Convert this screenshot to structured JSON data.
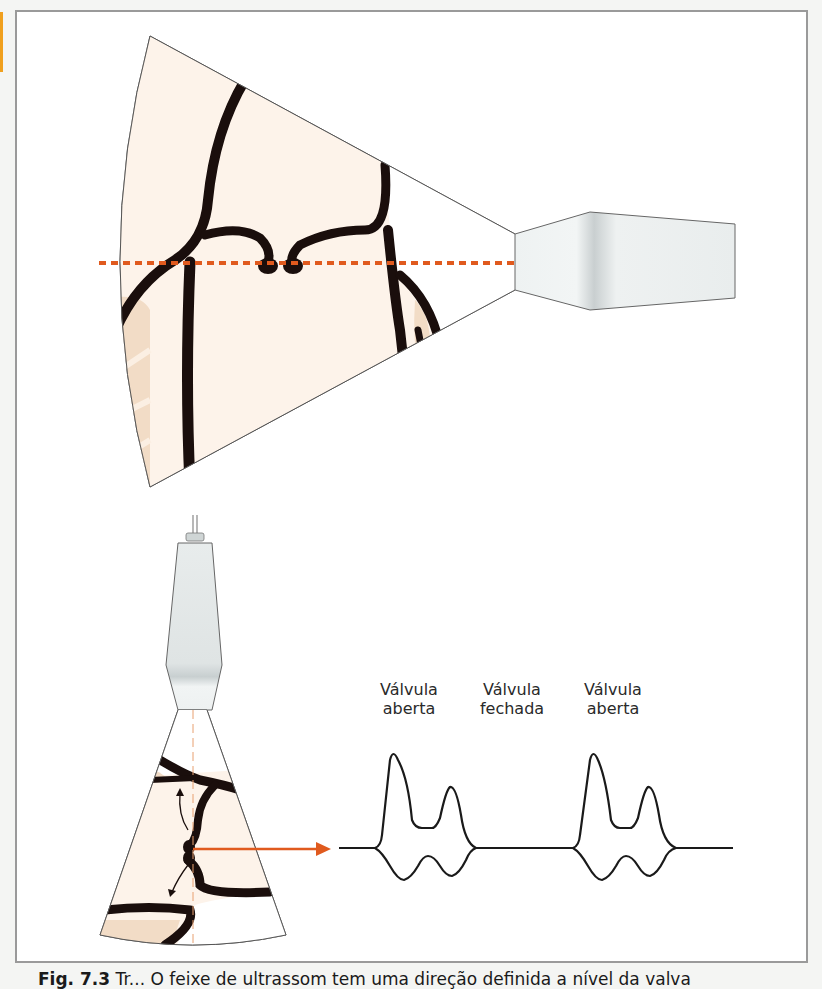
{
  "figure": {
    "accent_color": "#e05a1e",
    "tissue_color": "#fbefe3",
    "wall_color": "#1a0e0c",
    "border_color": "#9a9a9a"
  },
  "top_panel": {
    "description": "Sector scan with horizontal dotted scan line through valve leaflets",
    "scan_line_style": "dotted",
    "transducer": "transducer-probe-horizontal"
  },
  "bottom_panel": {
    "transducer": "transducer-probe-vertical",
    "arrow": "m-mode-projection-arrow",
    "labels": [
      {
        "line1": "Válvula",
        "line2": "aberta"
      },
      {
        "line1": "Válvula",
        "line2": "fechada"
      },
      {
        "line1": "Válvula",
        "line2": "aberta"
      }
    ]
  },
  "caption": {
    "prefix": "Fig. 7.3",
    "text": "Tr... O feixe de ultrassom tem uma direção definida a nível da valva"
  }
}
